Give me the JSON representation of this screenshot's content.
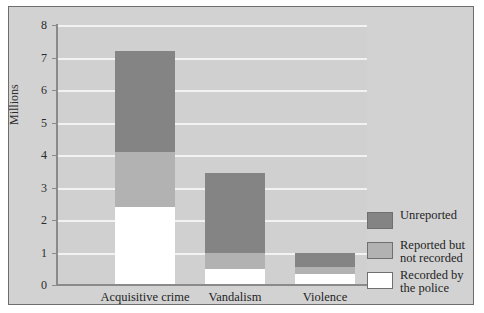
{
  "chart_data": {
    "type": "bar",
    "stacked": true,
    "title": "",
    "xlabel": "",
    "ylabel": "Millions",
    "ylim": [
      0,
      8
    ],
    "yticks": [
      "0",
      "1",
      "2",
      "3",
      "4",
      "5",
      "6",
      "7",
      "8"
    ],
    "grid": true,
    "legend_position": "right",
    "categories": [
      "Acquisitive crime",
      "Vandalism",
      "Violence"
    ],
    "series": [
      {
        "name": "Recorded by\nthe police",
        "key": "police",
        "color": "#ffffff",
        "values": [
          2.4,
          0.5,
          0.35
        ]
      },
      {
        "name": "Reported but\nnot recorded",
        "key": "notrecorded",
        "color": "#b2b2b2",
        "values": [
          1.7,
          0.5,
          0.2
        ]
      },
      {
        "name": "Unreported",
        "key": "unreported",
        "color": "#848484",
        "values": [
          3.1,
          2.45,
          0.45
        ]
      }
    ],
    "totals": [
      7.2,
      3.45,
      1.0
    ]
  },
  "legend": {
    "items": [
      {
        "label": "Unreported",
        "key": "unreported"
      },
      {
        "label": "Reported but\nnot recorded",
        "key": "notrecorded"
      },
      {
        "label": "Recorded by\nthe police",
        "key": "police"
      }
    ]
  },
  "colors": {
    "unreported": "#848484",
    "notrecorded": "#b2b2b2",
    "police": "#ffffff",
    "panel": "#d2d2d2",
    "plot": "#d0d0d0",
    "gridline": "#f2f2f2",
    "axis": "#8a8a8a"
  }
}
